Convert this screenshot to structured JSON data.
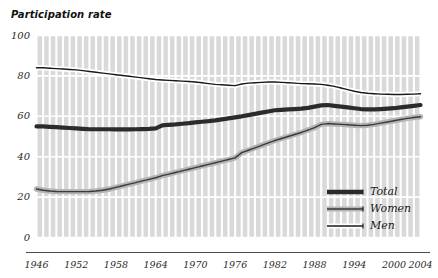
{
  "chart": {
    "title": "Participation rate"
  },
  "axis": {
    "y_ticks": [
      "100",
      "80",
      "60",
      "40",
      "20",
      "0"
    ],
    "x_ticks": [
      "1946",
      "1952",
      "1958",
      "1964",
      "1970",
      "1976",
      "1982",
      "1988",
      "1994",
      "2000",
      "2004"
    ]
  },
  "legend": {
    "items": [
      {
        "label": "Total",
        "color": "#2b2b2b"
      },
      {
        "label": "Women",
        "color": "#555555"
      },
      {
        "label": "Men",
        "color": "#1a1a1a"
      }
    ]
  },
  "colors": {
    "plot_background": "#d9d9d9",
    "gridline": "#ffffff",
    "total_line": "#2b2b2b",
    "women_line": "#3a3a3a",
    "women_halo": "#b5b5b5",
    "men_line": "#1a1a1a",
    "men_halo": "#ffffff",
    "text": "#2a2a2a",
    "axis_line": "#4a4a4a"
  },
  "chart_data": {
    "type": "line",
    "title": "Participation rate",
    "xlabel": "",
    "ylabel": "Participation rate",
    "xlim": [
      1946,
      2004
    ],
    "ylim": [
      0,
      100
    ],
    "grid": true,
    "legend_position": "bottom-right",
    "x": [
      1946,
      1947,
      1948,
      1949,
      1950,
      1951,
      1952,
      1953,
      1954,
      1955,
      1956,
      1957,
      1958,
      1959,
      1960,
      1961,
      1962,
      1963,
      1964,
      1965,
      1966,
      1967,
      1968,
      1969,
      1970,
      1971,
      1972,
      1973,
      1974,
      1975,
      1976,
      1977,
      1978,
      1979,
      1980,
      1981,
      1982,
      1983,
      1984,
      1985,
      1986,
      1987,
      1988,
      1989,
      1990,
      1991,
      1992,
      1993,
      1994,
      1995,
      1996,
      1997,
      1998,
      1999,
      2000,
      2001,
      2002,
      2003,
      2004
    ],
    "series": [
      {
        "name": "Total",
        "values": [
          55.0,
          55.0,
          54.8,
          54.6,
          54.4,
          54.2,
          54.0,
          53.8,
          53.6,
          53.6,
          53.6,
          53.6,
          53.5,
          53.5,
          53.5,
          53.6,
          53.7,
          53.8,
          54.0,
          55.5,
          55.8,
          56.0,
          56.3,
          56.6,
          57.0,
          57.3,
          57.6,
          58.0,
          58.5,
          59.0,
          59.5,
          60.0,
          60.6,
          61.2,
          61.8,
          62.4,
          63.0,
          63.2,
          63.4,
          63.6,
          63.8,
          64.2,
          64.8,
          65.4,
          65.6,
          65.2,
          64.8,
          64.4,
          64.0,
          63.6,
          63.4,
          63.4,
          63.6,
          63.8,
          64.0,
          64.4,
          64.8,
          65.2,
          65.6
        ]
      },
      {
        "name": "Women",
        "values": [
          24.0,
          23.4,
          23.0,
          22.8,
          22.7,
          22.7,
          22.7,
          22.7,
          22.8,
          23.0,
          23.4,
          24.0,
          24.8,
          25.6,
          26.4,
          27.2,
          28.0,
          28.8,
          29.6,
          30.6,
          31.4,
          32.2,
          33.0,
          33.8,
          34.6,
          35.4,
          36.2,
          37.0,
          37.8,
          38.6,
          39.4,
          42.0,
          43.2,
          44.4,
          45.6,
          46.8,
          48.0,
          49.0,
          50.0,
          51.0,
          52.0,
          53.2,
          54.4,
          56.0,
          56.4,
          56.2,
          56.0,
          55.8,
          55.6,
          55.4,
          55.6,
          56.0,
          56.6,
          57.2,
          57.8,
          58.4,
          59.0,
          59.4,
          59.8
        ]
      },
      {
        "name": "Men",
        "values": [
          84.0,
          84.0,
          83.8,
          83.6,
          83.4,
          83.2,
          83.0,
          82.6,
          82.2,
          81.8,
          81.4,
          81.0,
          80.6,
          80.2,
          79.8,
          79.4,
          79.0,
          78.6,
          78.2,
          78.0,
          77.8,
          77.6,
          77.4,
          77.2,
          77.0,
          76.6,
          76.2,
          75.8,
          75.6,
          75.4,
          75.2,
          76.0,
          76.4,
          76.6,
          76.8,
          77.0,
          77.0,
          76.8,
          76.6,
          76.4,
          76.2,
          76.1,
          76.0,
          75.8,
          75.4,
          74.8,
          74.0,
          73.2,
          72.4,
          71.8,
          71.4,
          71.2,
          71.0,
          70.9,
          70.8,
          70.8,
          70.9,
          71.0,
          71.2
        ]
      }
    ]
  }
}
